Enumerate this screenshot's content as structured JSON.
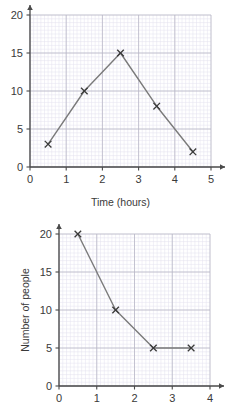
{
  "page": {
    "background": "#ffffff",
    "width": 231,
    "height": 418
  },
  "style": {
    "minor_grid_color": "#e3e1ee",
    "major_grid_color": "#b9b7c6",
    "axis_color": "#4a4a4a",
    "series_color": "#7a7a7a",
    "marker_color": "#3a3a3a",
    "text_color": "#3a3a3a"
  },
  "chart_data": [
    {
      "id": "time-distance-graph",
      "type": "line",
      "title": "",
      "xlabel": "Time (hours)",
      "ylabel": "",
      "xlim": [
        0,
        5
      ],
      "ylim": [
        0,
        20
      ],
      "xticks": [
        0,
        1,
        2,
        3,
        4,
        5
      ],
      "xtick_labels": [
        "0",
        "1",
        "2",
        "3",
        "4",
        "5"
      ],
      "yticks": [
        0,
        5,
        10,
        15,
        20
      ],
      "ytick_labels": [
        "0",
        "5",
        "10",
        "15",
        "20"
      ],
      "x_minor_step": 0.1,
      "y_minor_step": 0.5,
      "grid": true,
      "legend": "none",
      "marker": "x",
      "x": [
        0.5,
        1.5,
        2.5,
        3.5,
        4.5
      ],
      "values": [
        3,
        10,
        15,
        8,
        2
      ],
      "points": [
        {
          "x": 0.5,
          "y": 3
        },
        {
          "x": 1.5,
          "y": 10
        },
        {
          "x": 2.5,
          "y": 15
        },
        {
          "x": 3.5,
          "y": 8
        },
        {
          "x": 4.5,
          "y": 2
        }
      ],
      "x_axis_arrow": true,
      "y_axis_arrow": true
    },
    {
      "id": "number-of-people-graph",
      "type": "line",
      "title": "",
      "xlabel": "",
      "ylabel": "Number of people",
      "xlim": [
        0,
        4
      ],
      "ylim": [
        0,
        20
      ],
      "xticks": [
        0,
        1,
        2,
        3,
        4
      ],
      "xtick_labels": [
        "0",
        "1",
        "2",
        "3",
        "4"
      ],
      "yticks": [
        0,
        5,
        10,
        15,
        20
      ],
      "ytick_labels": [
        "0",
        "5",
        "10",
        "15",
        "20"
      ],
      "x_minor_step": 0.1,
      "y_minor_step": 0.5,
      "grid": true,
      "legend": "none",
      "marker": "x",
      "x": [
        0.5,
        1.5,
        2.5,
        3.5
      ],
      "values": [
        20,
        10,
        5,
        5
      ],
      "points": [
        {
          "x": 0.5,
          "y": 20
        },
        {
          "x": 1.5,
          "y": 10
        },
        {
          "x": 2.5,
          "y": 5
        },
        {
          "x": 3.5,
          "y": 5
        }
      ],
      "x_axis_arrow": true,
      "y_axis_arrow": true
    }
  ]
}
